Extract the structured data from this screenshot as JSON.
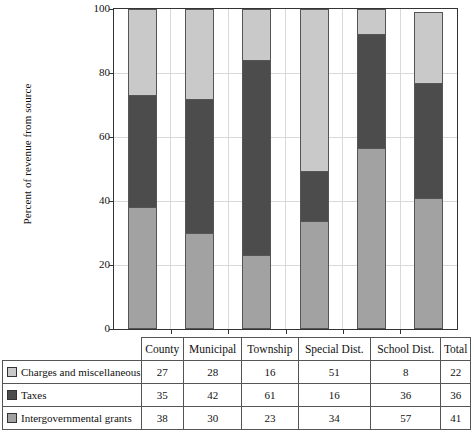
{
  "chart_data": {
    "type": "bar",
    "stacked": true,
    "title": "",
    "xlabel": "",
    "ylabel": "Percent of revenue from source",
    "ylim": [
      0,
      100
    ],
    "yticks": [
      0,
      20,
      40,
      60,
      80,
      100
    ],
    "grid": true,
    "legend_position": "table-row-labels",
    "categories": [
      "County",
      "Municipal",
      "Township",
      "Special Dist.",
      "School Dist.",
      "Total"
    ],
    "series": [
      {
        "name": "Charges and miscellaneous",
        "color": "#c9c9c9",
        "values": [
          27,
          28,
          16,
          51,
          8,
          22
        ]
      },
      {
        "name": "Taxes",
        "color": "#4c4c4c",
        "values": [
          35,
          42,
          61,
          16,
          36,
          36
        ]
      },
      {
        "name": "Intergovernmental grants",
        "color": "#a2a2a2",
        "values": [
          38,
          30,
          23,
          34,
          57,
          41
        ]
      }
    ]
  },
  "table": {
    "corner_label": "",
    "columns": [
      "County",
      "Municipal",
      "Township",
      "Special Dist.",
      "School Dist.",
      "Total"
    ],
    "rows": [
      {
        "label": "Charges and miscellaneous",
        "swatch": "#c9c9c9",
        "values": [
          27,
          28,
          16,
          51,
          8,
          22
        ]
      },
      {
        "label": "Taxes",
        "swatch": "#4c4c4c",
        "values": [
          35,
          42,
          61,
          16,
          36,
          36
        ]
      },
      {
        "label": "Intergovernmental grants",
        "swatch": "#a2a2a2",
        "values": [
          38,
          30,
          23,
          34,
          57,
          41
        ]
      }
    ]
  }
}
